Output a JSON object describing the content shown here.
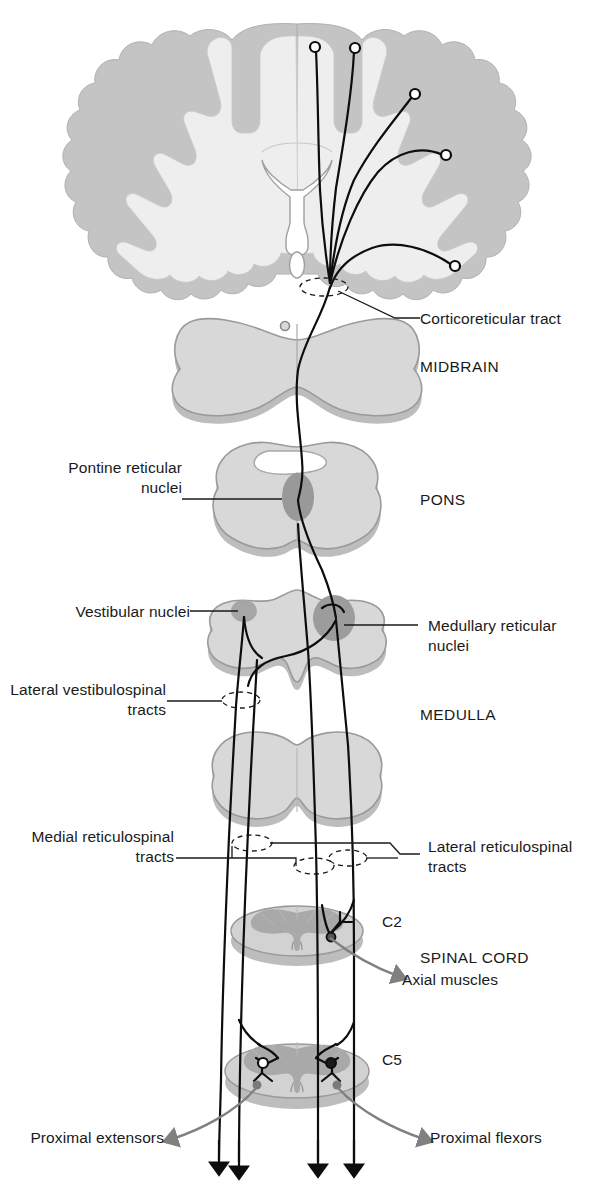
{
  "figure": {
    "type": "anatomical-diagram"
  },
  "regions": {
    "midbrain": "MIDBRAIN",
    "pons": "PONS",
    "medulla": "MEDULLA",
    "spinal_cord": "SPINAL CORD"
  },
  "levels": {
    "c2": "C2",
    "c5": "C5"
  },
  "labels": {
    "corticoreticular_tract": "Corticoreticular tract",
    "pontine_reticular_nuclei": "Pontine reticular\nnuclei",
    "vestibular_nuclei": "Vestibular nuclei",
    "medullary_reticular_nuclei": "Medullary reticular\nnuclei",
    "lateral_vestibulospinal_tracts": "Lateral vestibulospinal\ntracts",
    "medial_reticulospinal_tracts": "Medial reticulospinal\ntracts",
    "lateral_reticulospinal_tracts": "Lateral reticulospinal\ntracts"
  },
  "targets": {
    "axial_muscles": "Axial muscles",
    "proximal_extensors": "Proximal extensors",
    "proximal_flexors": "Proximal flexors"
  },
  "colors": {
    "background": "#ffffff",
    "text": "#1a1a1a",
    "leader_line": "#1a1a1a",
    "tract_line": "#0d0d0d",
    "target_arrow": "#808080",
    "cortex_gray_matter": "#bfbfbf",
    "cortex_white_matter": "#e8e8e8",
    "brainstem_fill": "#d5d5d5",
    "brainstem_outline": "#9a9a9a",
    "brainstem_shadow": "#bdbdbd",
    "nucleus_fill": "#9a9a9a",
    "cord_white_matter": "#cccccc",
    "cord_gray_matter": "#aaaaaa"
  }
}
